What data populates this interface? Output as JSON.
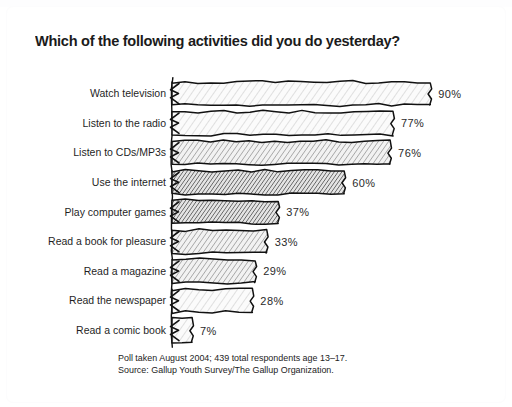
{
  "title": "Which of the following activities did you do yesterday?",
  "footnotes": {
    "line1": "Poll taken August 2004; 439 total respondents age 13–17.",
    "line2": "Source: Gallup Youth Survey/The Gallup Organization."
  },
  "colors": {
    "background": "#ffffff",
    "ink": "#1b1b1b",
    "bar_outline": "#111111",
    "bar_light": "#f0f0f0",
    "bar_mid": "#d3d3d3",
    "bar_dark": "#9e9e9e",
    "label_text": "#1f1f1f",
    "value_text": "#2a2a2a",
    "footnote_text": "#232323"
  },
  "chart_data": {
    "type": "bar",
    "orientation": "horizontal",
    "title": "Which of the following activities did you do yesterday?",
    "xlabel": "",
    "ylabel": "",
    "xlim": [
      0,
      100
    ],
    "grid": false,
    "legend": false,
    "value_suffix": "%",
    "categories": [
      "Watch television",
      "Listen to the radio",
      "Listen to CDs/MP3s",
      "Use the internet",
      "Play computer games",
      "Read a book for pleasure",
      "Read a magazine",
      "Read the newspaper",
      "Read a comic book"
    ],
    "values": [
      90,
      77,
      76,
      60,
      37,
      33,
      29,
      28,
      7
    ],
    "value_labels": [
      "90%",
      "77%",
      "76%",
      "60%",
      "37%",
      "33%",
      "29%",
      "28%",
      "7%"
    ],
    "shades": [
      "light",
      "light",
      "mid",
      "dark",
      "dark",
      "mid",
      "mid",
      "light",
      "light"
    ]
  }
}
